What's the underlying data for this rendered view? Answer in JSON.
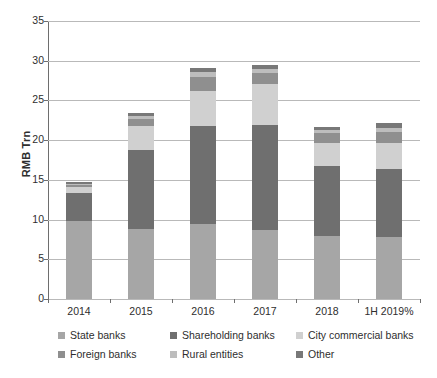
{
  "chart_data": {
    "type": "bar",
    "subtype": "stacked-bar",
    "title": "",
    "xlabel": "",
    "ylabel": "RMB Trn",
    "ylim": [
      0,
      35
    ],
    "yticks": [
      0,
      5,
      10,
      15,
      20,
      25,
      30,
      35
    ],
    "grid": true,
    "legend_position": "bottom",
    "categories": [
      "2014",
      "2015",
      "2016",
      "2017",
      "2018",
      "1H 2019%"
    ],
    "series": [
      {
        "name": "State banks",
        "color": "#a6a6a6",
        "values": [
          9.8,
          8.8,
          9.5,
          8.7,
          7.9,
          7.8
        ]
      },
      {
        "name": "Shareholding banks",
        "color": "#6f6f6f",
        "values": [
          3.6,
          10.0,
          12.3,
          13.2,
          8.9,
          8.6
        ]
      },
      {
        "name": "City commercial banks",
        "color": "#d0d0d0",
        "values": [
          0.7,
          3.0,
          4.4,
          5.2,
          2.9,
          3.3
        ]
      },
      {
        "name": "Foreign banks",
        "color": "#8f8f8f",
        "values": [
          0.2,
          0.9,
          1.7,
          1.3,
          1.2,
          1.3
        ]
      },
      {
        "name": "Rural entities",
        "color": "#bdbdbd",
        "values": [
          0.2,
          0.4,
          0.7,
          0.6,
          0.4,
          0.5
        ]
      },
      {
        "name": "Other",
        "color": "#787878",
        "values": [
          0.2,
          0.3,
          0.5,
          0.5,
          0.4,
          0.6
        ]
      }
    ],
    "totals": [
      14.7,
      23.4,
      29.1,
      29.5,
      21.7,
      22.1
    ]
  },
  "axis": {
    "y_title": "RMB Trn"
  }
}
